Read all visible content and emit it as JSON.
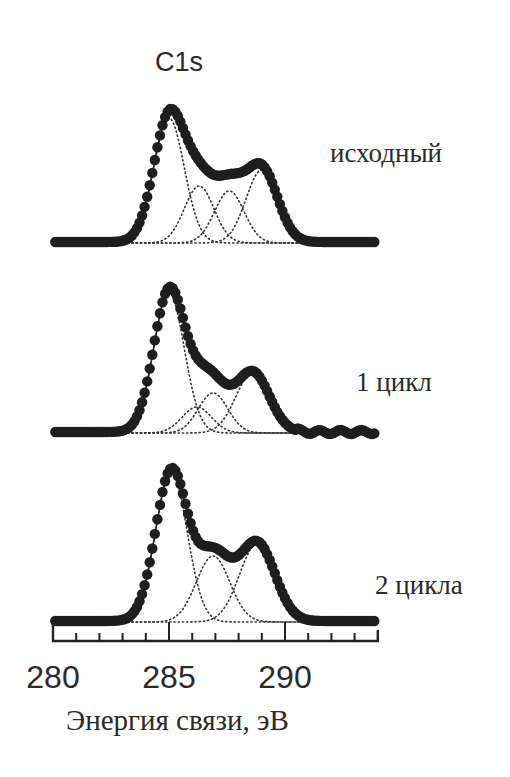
{
  "chart_data": {
    "type": "line",
    "title": "C1s",
    "xlabel": "Энергия связи, эВ",
    "ylabel": "",
    "xlim": [
      280,
      294
    ],
    "x_ticks_major": [
      280,
      285,
      290
    ],
    "x_tick_labels": [
      "280",
      "285",
      "290"
    ],
    "x_ticks_minor_step": 1,
    "grid": false,
    "legend": "none",
    "series": [
      {
        "name": "исходный",
        "label": "исходный",
        "style": "filled circles (experimental) + solid fit line, dotted component peaks",
        "baseline_px": 243,
        "components": [
          {
            "center_eV": 285.0,
            "fwhm_eV": 1.55,
            "height": 125
          },
          {
            "center_eV": 286.3,
            "fwhm_eV": 1.5,
            "height": 57
          },
          {
            "center_eV": 287.6,
            "fwhm_eV": 1.5,
            "height": 52
          },
          {
            "center_eV": 289.0,
            "fwhm_eV": 1.6,
            "height": 73
          }
        ]
      },
      {
        "name": "1 цикл",
        "label": "1 цикл",
        "style": "filled circles (experimental) + solid fit line, dotted component peaks",
        "baseline_px": 433,
        "components": [
          {
            "center_eV": 285.0,
            "fwhm_eV": 1.55,
            "height": 140
          },
          {
            "center_eV": 286.2,
            "fwhm_eV": 1.5,
            "height": 26
          },
          {
            "center_eV": 286.9,
            "fwhm_eV": 1.5,
            "height": 40
          },
          {
            "center_eV": 288.6,
            "fwhm_eV": 1.7,
            "height": 60
          }
        ]
      },
      {
        "name": "2 цикла",
        "label": "2 цикла",
        "style": "filled circles (experimental) + solid fit line, dotted component peaks",
        "baseline_px": 622,
        "components": [
          {
            "center_eV": 285.1,
            "fwhm_eV": 1.6,
            "height": 150
          },
          {
            "center_eV": 286.9,
            "fwhm_eV": 1.7,
            "height": 66
          },
          {
            "center_eV": 288.8,
            "fwhm_eV": 1.8,
            "height": 78
          }
        ]
      }
    ]
  },
  "labels": {
    "title": "C1s",
    "series_1": "исходный",
    "series_2": "1 цикл",
    "series_3": "2 цикла",
    "tick_280": "280",
    "tick_285": "285",
    "tick_290": "290",
    "xlabel": "Энергия связи, эВ"
  },
  "colors": {
    "ink": "#222222",
    "dots": "#1e1e1e",
    "text": "#2a2a2a"
  }
}
